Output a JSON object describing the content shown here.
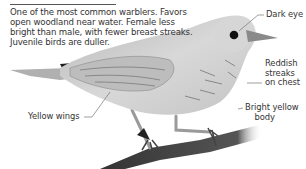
{
  "description": {
    "text": "One of the most common warblers. Favors open woodland near water. Female less bright than male, with fewer breast streaks. Juvenile birds are duller."
  },
  "labels": {
    "dark_eye": "Dark eye",
    "reddish_streaks": [
      "Reddish",
      "streaks",
      "on chest"
    ],
    "bright_yellow_body": [
      "Bright yellow",
      "body"
    ],
    "yellow_wings": "Yellow wings"
  },
  "colors": {
    "text": "#333333",
    "leader_lines": "#777777",
    "bird_body": "#cfcfcf",
    "branch": "#3a3a3a"
  }
}
